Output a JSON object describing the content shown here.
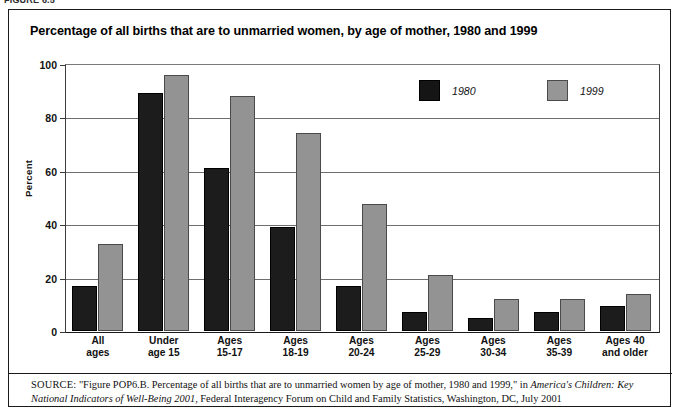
{
  "figure_label": "FIGURE 6.5",
  "title": "Percentage of all births that are to unmarried women, by age of mother, 1980 and 1999",
  "legend": {
    "entries": [
      {
        "label": "1980",
        "color": "#151515"
      },
      {
        "label": "1999",
        "color": "#969696"
      }
    ]
  },
  "axis": {
    "ylabel": "Percent",
    "yticks": [
      "0",
      "20",
      "40",
      "60",
      "80",
      "100"
    ]
  },
  "source": {
    "label": "SOURCE:",
    "text_before_italic": " \"Figure POP6.B. Percentage of all births that are to unmarried women by age of mother, 1980 and 1999,\" in ",
    "italic_title": "America's Children: Key National Indicators of Well-Being 2001",
    "text_after_italic": ", Federal Interagency Forum on Child and Family Statistics, Washington, DC, July 2001"
  },
  "chart_data": {
    "type": "bar",
    "title": "Percentage of all births that are to unmarried women, by age of mother, 1980 and 1999",
    "xlabel": "",
    "ylabel": "Percent",
    "ylim": [
      0,
      100
    ],
    "ytick_values": [
      0,
      20,
      40,
      60,
      80,
      100
    ],
    "grid": true,
    "legend_position": "top-right-inside",
    "categories": [
      "All ages",
      "Under age 15",
      "Ages 15-17",
      "Ages 18-19",
      "Ages 20-24",
      "Ages 25-29",
      "Ages 30-34",
      "Ages 35-39",
      "Ages 40 and older"
    ],
    "category_lines": [
      [
        "All",
        "ages"
      ],
      [
        "Under",
        "age 15"
      ],
      [
        "Ages",
        "15-17"
      ],
      [
        "Ages",
        "18-19"
      ],
      [
        "Ages",
        "20-24"
      ],
      [
        "Ages",
        "25-29"
      ],
      [
        "Ages",
        "30-34"
      ],
      [
        "Ages",
        "35-39"
      ],
      [
        "Ages 40",
        "and older"
      ]
    ],
    "series": [
      {
        "name": "1980",
        "color": "#151515",
        "values": [
          17,
          89,
          61,
          39,
          17,
          7,
          5,
          7,
          9.5
        ]
      },
      {
        "name": "1999",
        "color": "#969696",
        "values": [
          32.5,
          96,
          88,
          74,
          47.5,
          21,
          12,
          12,
          14
        ]
      }
    ]
  }
}
